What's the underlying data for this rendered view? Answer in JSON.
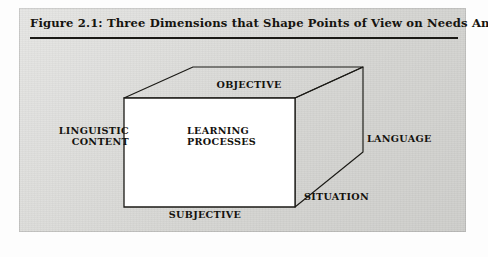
{
  "figure": {
    "caption": "Figure 2.1: Three Dimensions that Shape Points of View on Needs Analysis",
    "panel_color": "#d9d9d6",
    "front_face_color": "#ffffff",
    "line_color": "#1b1a16",
    "diagram_type": "cube-3d",
    "labels": {
      "top": "OBJECTIVE",
      "bottom": "SUBJECTIVE",
      "left": "LINGUISTIC\nCONTENT",
      "right_inner": "LEARNING\nPROCESSES",
      "right_outer": "LANGUAGE",
      "bottom_right": "SITUATION"
    },
    "dimensions": [
      {
        "axis": "vertical",
        "pole_a": "OBJECTIVE",
        "pole_b": "SUBJECTIVE"
      },
      {
        "axis": "horizontal",
        "pole_a": "LINGUISTIC CONTENT",
        "pole_b": "LEARNING PROCESSES"
      },
      {
        "axis": "depth",
        "pole_a": "LANGUAGE",
        "pole_b": "SITUATION"
      }
    ]
  }
}
